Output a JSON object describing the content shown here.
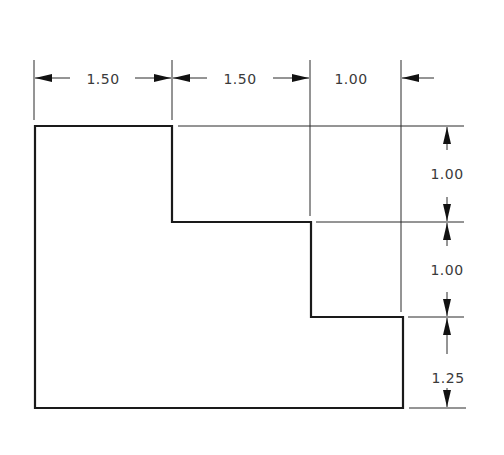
{
  "drawing": {
    "type": "dimensioned-orthographic-view",
    "shape": "stepped L profile (two steps)",
    "units": "inches",
    "colors": {
      "line": "#1a1a1a",
      "text": "#3a3a3a",
      "background": "#ffffff"
    },
    "horizontal_dimensions": [
      {
        "label": "1.50",
        "from": "left edge",
        "to": "first step"
      },
      {
        "label": "1.50",
        "from": "first step",
        "to": "second step"
      },
      {
        "label": "1.00",
        "from": "second step",
        "to": "right edge"
      }
    ],
    "vertical_dimensions": [
      {
        "label": "1.00",
        "from": "top edge",
        "to": "first step"
      },
      {
        "label": "1.00",
        "from": "first step",
        "to": "second step"
      },
      {
        "label": "1.25",
        "from": "second step",
        "to": "bottom edge"
      }
    ]
  }
}
